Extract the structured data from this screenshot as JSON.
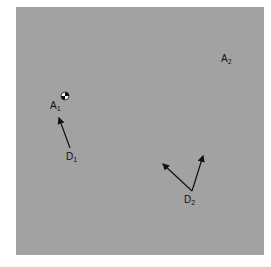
{
  "diagram": {
    "background_color": "#a2a2a2",
    "labels": [
      {
        "id": "A1",
        "base": "A",
        "sub": "1",
        "x": 50,
        "y": 101
      },
      {
        "id": "A2",
        "base": "A",
        "sub": "2",
        "x": 221,
        "y": 54
      },
      {
        "id": "D1",
        "base": "D",
        "sub": "1",
        "x": 66,
        "y": 152
      },
      {
        "id": "D2",
        "base": "D",
        "sub": "2",
        "x": 184,
        "y": 195
      }
    ],
    "ball": {
      "x": 65,
      "y": 96,
      "r": 4
    },
    "arrows": [
      {
        "from": "D1",
        "x1": 70,
        "y1": 148,
        "x2": 59,
        "y2": 118
      },
      {
        "from": "D2",
        "x1": 192,
        "y1": 191,
        "x2": 163,
        "y2": 164
      },
      {
        "from": "D2",
        "x1": 192,
        "y1": 191,
        "x2": 203,
        "y2": 156
      }
    ]
  }
}
